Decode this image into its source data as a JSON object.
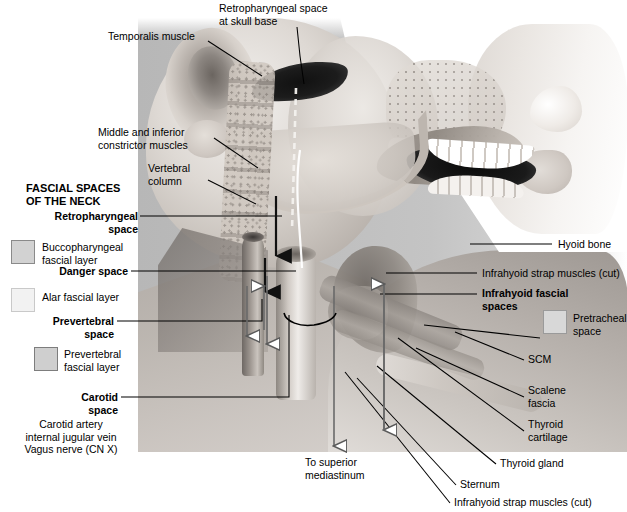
{
  "figure": {
    "title": "FASCIAL SPACES\nOF THE NECK",
    "background_color": "#ffffff",
    "plate_tint": "#c4c4c4"
  },
  "legend": {
    "title": "FASCIAL SPACES\nOF THE NECK",
    "swatches": [
      {
        "name": "buccopharyngeal-fascial-layer",
        "label": "Buccopharyngeal\nfascial layer",
        "color": "#d2d2d2",
        "border": "#8a8a8a"
      },
      {
        "name": "alar-fascial-layer",
        "label": "Alar fascial layer",
        "color": "#f2f2f2",
        "border": "#c9c9c9"
      },
      {
        "name": "prevertebral-fascial-layer",
        "label": "Prevertebral\nfascial layer",
        "color": "#cfcfcf",
        "border": "#7d7d7d"
      },
      {
        "name": "pretracheal-space",
        "label": "Pretracheal\nspace",
        "color": "#d8d8d8",
        "border": "#9a9a9a"
      }
    ]
  },
  "callouts": {
    "left": [
      {
        "name": "retropharyngeal-space",
        "label": "Retropharyngeal\nspace",
        "bold": true
      },
      {
        "name": "danger-space",
        "label": "Danger space",
        "bold": true
      },
      {
        "name": "prevertebral-space",
        "label": "Prevertebral\nspace",
        "bold": true
      },
      {
        "name": "carotid-space",
        "label": "Carotid\nspace",
        "bold": true
      },
      {
        "name": "carotid-space-contents",
        "label": "Carotid artery\ninternal jugular vein\nVagus nerve (CN X)",
        "bold": false
      }
    ],
    "top": [
      {
        "name": "temporalis-muscle",
        "label": "Temporalis muscle",
        "bold": false
      },
      {
        "name": "retropharyngeal-space-at-skull-base",
        "label": "Retropharyngeal space\nat skull base",
        "bold": false
      },
      {
        "name": "middle-and-inferior-constrictor-muscles",
        "label": "Middle and inferior\nconstrictor muscles",
        "bold": false
      },
      {
        "name": "vertebral-column",
        "label": "Vertebral\ncolumn",
        "bold": false
      }
    ],
    "right": [
      {
        "name": "hyoid-bone",
        "label": "Hyoid bone",
        "bold": false
      },
      {
        "name": "infrahyoid-strap-muscles-cut-upper",
        "label": "Infrahyoid strap muscles (cut)",
        "bold": false
      },
      {
        "name": "infrahyoid-fascial-spaces",
        "label": "Infrahyoid fascial\nspaces",
        "bold": true
      },
      {
        "name": "scm",
        "label": "SCM",
        "bold": false
      },
      {
        "name": "scalene-fascia",
        "label": "Scalene\nfascia",
        "bold": false
      },
      {
        "name": "thyroid-cartilage",
        "label": "Thyroid\ncartilage",
        "bold": false
      },
      {
        "name": "thyroid-gland",
        "label": "Thyroid gland",
        "bold": false
      },
      {
        "name": "sternum",
        "label": "Sternum",
        "bold": false
      },
      {
        "name": "infrahyoid-strap-muscles-cut-lower",
        "label": "Infrahyoid strap muscles (cut)",
        "bold": false
      }
    ],
    "bottom": [
      {
        "name": "to-superior-mediastinum",
        "label": "To superior\nmediastinum",
        "bold": false
      }
    ]
  }
}
